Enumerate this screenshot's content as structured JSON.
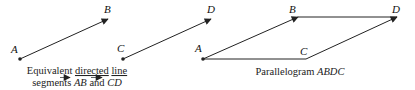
{
  "figure_left": {
    "points": {
      "A": {
        "label": "A",
        "x": 20,
        "y": 59
      },
      "B": {
        "label": "B",
        "x": 108,
        "y": 19
      },
      "C": {
        "label": "C",
        "x": 123,
        "y": 59
      },
      "D": {
        "label": "D",
        "x": 211,
        "y": 19
      }
    },
    "caption_line1_prefix": "Equivalent ",
    "caption_line1_u1": "directed",
    "caption_line1_sp": " ",
    "caption_line1_u2": "line",
    "caption_line2_prefix": "segments ",
    "caption_vec1": "AB",
    "caption_and": " and ",
    "caption_vec2": "CD"
  },
  "figure_right": {
    "points": {
      "A": {
        "label": "A",
        "x": 203,
        "y": 59
      },
      "B": {
        "label": "B",
        "x": 298,
        "y": 17
      },
      "D": {
        "label": "D",
        "x": 397,
        "y": 17
      },
      "C": {
        "label": "C",
        "x": 306,
        "y": 59
      }
    },
    "caption_prefix": "Parallelogram ",
    "caption_name": "ABDC"
  },
  "colors": {
    "stroke": "#222222",
    "background": "#ffffff"
  }
}
